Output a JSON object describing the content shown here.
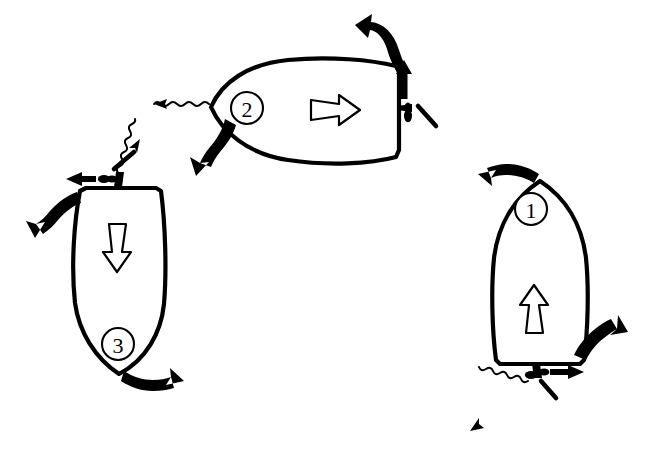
{
  "figure": {
    "kind": "hand-drawn-nautical-maneuver-diagram",
    "background_color": "#ffffff",
    "ink_color": "#000000",
    "width": 646,
    "height": 471,
    "caption": ""
  },
  "boats": [
    {
      "id": "boat-1",
      "badge_label": "1",
      "position": "right",
      "orientation": "bow-up",
      "hull_shape": "pointed-bow-transom-stern",
      "interior_arrow": {
        "name": "thrust-arrow-up",
        "direction": "up",
        "style": "open-outline"
      },
      "motor": {
        "name": "outboard-motor",
        "location": "stern-center",
        "tiller_angle": "angled-down-right"
      },
      "arrows": [
        {
          "name": "bow-swing-arrow-left",
          "style": "solid-curved",
          "direction": "left"
        },
        {
          "name": "stern-swing-arrow-up-right",
          "style": "solid-curved",
          "direction": "up-right"
        },
        {
          "name": "prop-thrust-arrow-right",
          "style": "solid-straight",
          "direction": "right"
        }
      ],
      "wash": {
        "name": "prop-wash-wavy-arrow",
        "style": "wavy",
        "direction": "down-left"
      }
    },
    {
      "id": "boat-2",
      "badge_label": "2",
      "position": "top-center",
      "orientation": "bow-left",
      "hull_shape": "pointed-bow-transom-stern",
      "interior_arrow": {
        "name": "thrust-arrow-right",
        "direction": "right",
        "style": "open-outline"
      },
      "motor": {
        "name": "outboard-motor",
        "location": "stern-center",
        "tiller_angle": "angled-down-right"
      },
      "arrows": [
        {
          "name": "stern-swing-arrow-up-left",
          "style": "solid-curved",
          "direction": "up-left"
        },
        {
          "name": "bow-swing-arrow-down-left",
          "style": "solid-curved",
          "direction": "down-left"
        },
        {
          "name": "prop-thrust-arrow-up",
          "style": "solid-straight",
          "direction": "up"
        }
      ],
      "wash": {
        "name": "prop-wash-wavy-arrow",
        "style": "wavy",
        "direction": "left"
      }
    },
    {
      "id": "boat-3",
      "badge_label": "3",
      "position": "left",
      "orientation": "bow-down",
      "hull_shape": "pointed-bow-transom-stern",
      "interior_arrow": {
        "name": "thrust-arrow-down",
        "direction": "down",
        "style": "open-outline"
      },
      "motor": {
        "name": "outboard-motor",
        "location": "stern-center",
        "tiller_angle": "angled-up-right"
      },
      "arrows": [
        {
          "name": "stern-swing-arrow-left",
          "style": "solid-straight",
          "direction": "left"
        },
        {
          "name": "hull-swing-arrow-down-left",
          "style": "solid-curved",
          "direction": "down-left"
        },
        {
          "name": "bow-swing-arrow-right",
          "style": "solid-curved",
          "direction": "right"
        }
      ],
      "wash": {
        "name": "prop-wash-wavy-arrow",
        "style": "wavy",
        "direction": "up-right"
      }
    }
  ]
}
